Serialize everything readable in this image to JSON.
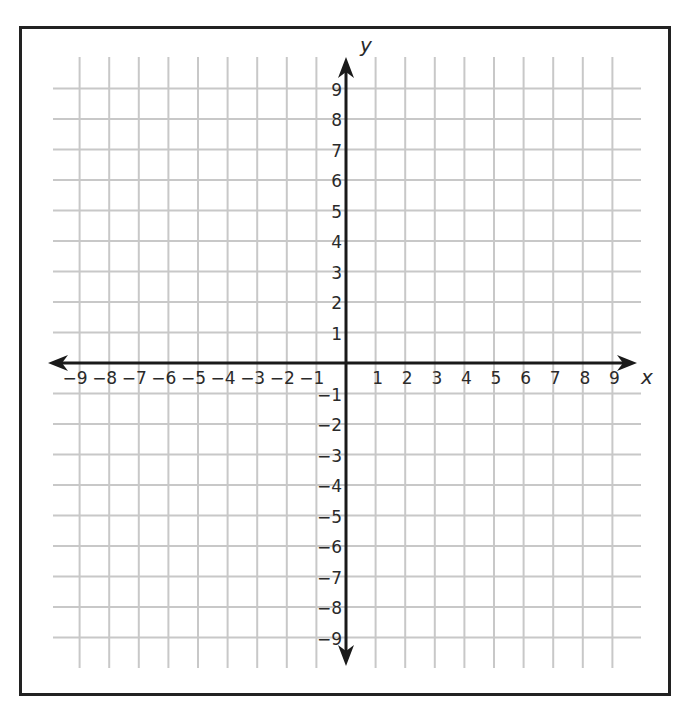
{
  "chart_data": {
    "type": "scatter",
    "title": "",
    "subtitle": "",
    "xlabel": "x",
    "ylabel": "y",
    "xlim": [
      -9,
      9
    ],
    "ylim": [
      -9,
      9
    ],
    "grid": true,
    "legend": null,
    "x_ticks": [
      -9,
      -8,
      -7,
      -6,
      -5,
      -4,
      -3,
      -2,
      -1,
      1,
      2,
      3,
      4,
      5,
      6,
      7,
      8,
      9
    ],
    "y_ticks": [
      9,
      8,
      7,
      6,
      5,
      4,
      3,
      2,
      1,
      -1,
      -2,
      -3,
      -4,
      -5,
      -6,
      -7,
      -8,
      -9
    ],
    "x_tick_labels": [
      "−9",
      "−8",
      "−7",
      "−6",
      "−5",
      "−4",
      "−3",
      "−2",
      "−1",
      "1",
      "2",
      "3",
      "4",
      "5",
      "6",
      "7",
      "8",
      "9"
    ],
    "y_tick_labels": [
      "9",
      "8",
      "7",
      "6",
      "5",
      "4",
      "3",
      "2",
      "1",
      "−1",
      "−2",
      "−3",
      "−4",
      "−5",
      "−6",
      "−7",
      "−8",
      "−9"
    ],
    "series": []
  },
  "colors": {
    "grid": "#c8c8c8",
    "axis": "#1a1a1a",
    "frame": "#222222",
    "text": "#2a2a2a"
  }
}
